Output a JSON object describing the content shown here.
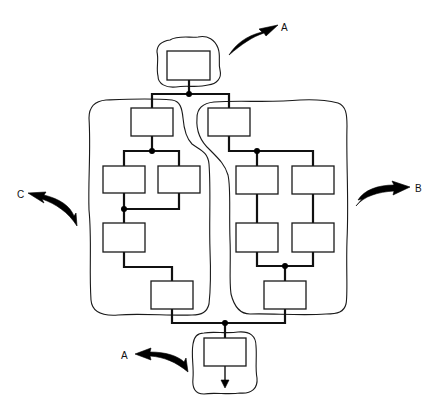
{
  "figure": {
    "type": "block-diagram",
    "colors": {
      "line": "#111111",
      "background": "#ffffff"
    }
  },
  "labels": {
    "top_arrow": "A",
    "left_arrow": "C",
    "right_arrow": "B",
    "bottom_arrow": "A"
  },
  "regions": [
    {
      "id": "top",
      "label": "A",
      "blocks": 1
    },
    {
      "id": "left",
      "label": "C",
      "blocks": 5
    },
    {
      "id": "right",
      "label": "B",
      "blocks": 5
    },
    {
      "id": "bottom",
      "label": "A",
      "blocks": 1
    }
  ]
}
